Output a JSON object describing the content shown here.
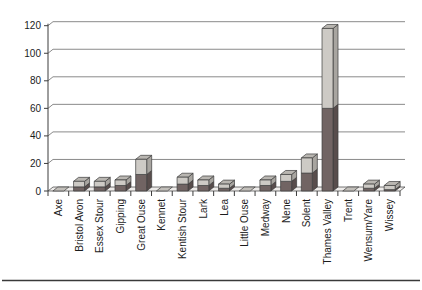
{
  "chart_data": {
    "type": "bar",
    "subtype": "3d-stacked-column",
    "title": "",
    "xlabel": "",
    "ylabel": "",
    "ylim": [
      0,
      120
    ],
    "yticks": [
      0,
      20,
      40,
      60,
      80,
      100,
      120
    ],
    "grid": true,
    "legend": "none",
    "categories": [
      "Axe",
      "Bristol Avon",
      "Essex Stour",
      "Gipping",
      "Great Ouse",
      "Kennet",
      "Kentish Stour",
      "Lark",
      "Lea",
      "Little Ouse",
      "Medway",
      "Nene",
      "Solent",
      "Thames Valley",
      "Trent",
      "Wensum/Yare",
      "Wissey"
    ],
    "series": [
      {
        "name": "dark-bottom-segment",
        "values": [
          0.5,
          3,
          3,
          4,
          12,
          0.5,
          5,
          4,
          2,
          0.5,
          4,
          7,
          13,
          60,
          0.5,
          2,
          1
        ]
      },
      {
        "name": "light-top-segment",
        "values": [
          0.5,
          4,
          4,
          4,
          11,
          0.5,
          5,
          4,
          3,
          0.5,
          4,
          5,
          11,
          58,
          0.5,
          3,
          3
        ]
      }
    ]
  },
  "colors": {
    "dark_front": "#716463",
    "dark_side": "#584d4c",
    "light_front": "#cdcac5",
    "light_side": "#a8a5a0",
    "light_top": "#b9b6b1",
    "flat_marker": "#c2bfba",
    "outline": "#3c3c3c",
    "gridline": "#8a8a8a",
    "axis": "#3c3c3c",
    "floor_fill": "#eeecea",
    "bottom_rule": "#3a3a3a"
  }
}
